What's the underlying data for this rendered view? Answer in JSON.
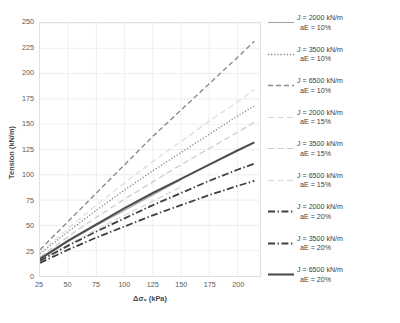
{
  "chart_data": {
    "type": "line",
    "title": "",
    "xlabel": "Δσ₀ (kPa)",
    "ylabel": "Tension (kN/m)",
    "xlim": [
      25,
      220
    ],
    "ylim": [
      0,
      250
    ],
    "xticks": [
      25,
      50,
      75,
      100,
      125,
      150,
      175,
      200
    ],
    "yticks": [
      0,
      25,
      50,
      75,
      100,
      125,
      150,
      175,
      200,
      225,
      250
    ],
    "grid": true,
    "legend_position": "right",
    "series": [
      {
        "name": "J = 2000 kN/m aE = 10%",
        "label_line1": "J = 2000 kN/m",
        "label_line2": "aE = 10%",
        "stiffness_kN_per_m": 2000,
        "strain_percent": 10,
        "style": "solid",
        "color": "#a6a6a6",
        "width": 1.1,
        "x": [
          25,
          50,
          75,
          100,
          125,
          150
        ],
        "y": [
          16,
          34,
          50,
          65,
          80,
          95
        ]
      },
      {
        "name": "J = 3500 kN/m aE = 10%",
        "label_line1": "J = 3500 kN/m",
        "label_line2": "aE = 10%",
        "stiffness_kN_per_m": 3500,
        "strain_percent": 10,
        "style": "dotted",
        "color": "#808080",
        "width": 1.3,
        "x": [
          25,
          50,
          75,
          100,
          125,
          150,
          175,
          200,
          215
        ],
        "y": [
          22,
          44,
          65,
          85,
          104,
          122,
          140,
          158,
          168
        ]
      },
      {
        "name": "J = 6500 kN/m aE = 10%",
        "label_line1": "J = 6500 kN/m",
        "label_line2": "aE = 10%",
        "stiffness_kN_per_m": 6500,
        "strain_percent": 10,
        "style": "dashed",
        "color": "#8c8c8c",
        "width": 1.4,
        "x": [
          25,
          50,
          75,
          100,
          125,
          150,
          175,
          200,
          215
        ],
        "y": [
          26,
          54,
          82,
          110,
          138,
          164,
          190,
          216,
          232
        ]
      },
      {
        "name": "J = 2000 kN/m aE = 15%",
        "label_line1": "J = 2000 kN/m",
        "label_line2": "aE = 15%",
        "stiffness_kN_per_m": 2000,
        "strain_percent": 15,
        "style": "dashed-light",
        "color": "#d4d4d4",
        "width": 1.1,
        "x": [
          25,
          50,
          75,
          100,
          125,
          150
        ],
        "y": [
          15,
          31,
          46,
          60,
          74,
          88
        ]
      },
      {
        "name": "J = 3500 kN/m aE = 15%",
        "label_line1": "J = 3500 kN/m",
        "label_line2": "aE = 15%",
        "stiffness_kN_per_m": 3500,
        "strain_percent": 15,
        "style": "dashed-light",
        "color": "#c9c9c9",
        "width": 1.2,
        "x": [
          25,
          50,
          75,
          100,
          125,
          150,
          175,
          200,
          215
        ],
        "y": [
          19,
          39,
          58,
          76,
          93,
          110,
          126,
          142,
          152
        ]
      },
      {
        "name": "J = 6500 kN/m aE = 15%",
        "label_line1": "J = 6500 kN/m",
        "label_line2": "aE = 15%",
        "stiffness_kN_per_m": 6500,
        "strain_percent": 15,
        "style": "dashed-light",
        "color": "#dedede",
        "width": 1.3,
        "x": [
          25,
          50,
          75,
          100,
          125,
          150,
          175,
          200,
          215
        ],
        "y": [
          23,
          47,
          70,
          92,
          113,
          133,
          153,
          172,
          184
        ]
      },
      {
        "name": "J = 2000 kN/m aE = 20%",
        "label_line1": "J = 2000 kN/m",
        "label_line2": "aE = 20%",
        "stiffness_kN_per_m": 2000,
        "strain_percent": 20,
        "style": "dash-dot",
        "color": "#3f3f3f",
        "width": 1.8,
        "x": [
          25,
          50,
          75,
          100,
          125,
          150,
          175,
          200,
          215
        ],
        "y": [
          13,
          26,
          38,
          49,
          60,
          70,
          80,
          89,
          94
        ]
      },
      {
        "name": "J = 3500 kN/m aE = 20%",
        "label_line1": "J = 3500 kN/m",
        "label_line2": "aE = 20%",
        "stiffness_kN_per_m": 3500,
        "strain_percent": 20,
        "style": "dash-dot",
        "color": "#3f3f3f",
        "width": 1.8,
        "x": [
          25,
          50,
          75,
          100,
          125,
          150,
          175,
          200,
          215
        ],
        "y": [
          15,
          30,
          44,
          57,
          70,
          82,
          94,
          105,
          111
        ]
      },
      {
        "name": "J = 6500 kN/m aE = 20%",
        "label_line1": "J = 6500 kN/m",
        "label_line2": "aE = 20%",
        "stiffness_kN_per_m": 6500,
        "strain_percent": 20,
        "style": "solid-thick",
        "color": "#4d4d4d",
        "width": 2.1,
        "x": [
          25,
          50,
          75,
          100,
          125,
          150,
          175,
          200,
          215
        ],
        "y": [
          17,
          35,
          51,
          67,
          82,
          96,
          110,
          124,
          132
        ]
      }
    ]
  },
  "axes": {
    "y_title": "Tension (kN/m)",
    "x_title": "Δσ₀ (kPa)"
  }
}
